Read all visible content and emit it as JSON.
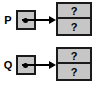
{
  "diagram": {
    "colors": {
      "box_fill": "#c6c6c6",
      "border": "#1a1a1a",
      "background": "#ffffff",
      "text": "#000000"
    },
    "groups": [
      {
        "id": "p",
        "label": "P",
        "pointer_icon": "pointer-dot-icon",
        "arrow_icon": "arrow-right-icon",
        "node": {
          "cells": [
            {
              "value": "?"
            },
            {
              "value": "?"
            }
          ]
        }
      },
      {
        "id": "q",
        "label": "Q",
        "pointer_icon": "pointer-dot-icon",
        "arrow_icon": "arrow-right-icon",
        "node": {
          "cells": [
            {
              "value": "?"
            },
            {
              "value": "?"
            }
          ]
        }
      }
    ]
  }
}
